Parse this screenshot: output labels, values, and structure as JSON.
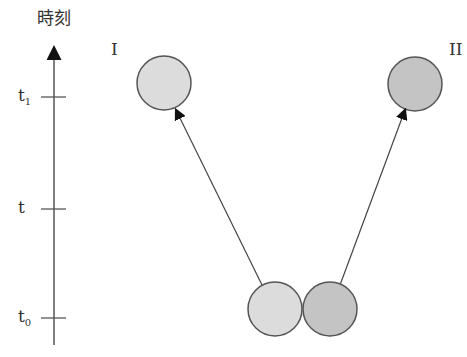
{
  "axis": {
    "title": "時刻",
    "ticks": [
      {
        "label": "t",
        "sub": "1",
        "y": 97
      },
      {
        "label": "t",
        "sub": "",
        "y": 209
      },
      {
        "label": "t",
        "sub": "0",
        "y": 318
      }
    ]
  },
  "labels": {
    "ball_one": "I",
    "ball_two": "II"
  },
  "colors": {
    "ball_light": "#dcdcdc",
    "ball_dark": "#c4c4c4",
    "stroke": "#555555"
  }
}
